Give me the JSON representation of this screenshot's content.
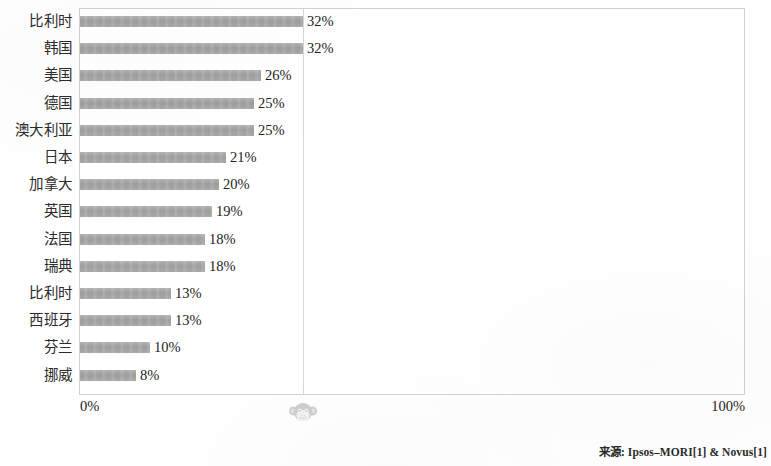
{
  "chart_data": {
    "type": "bar",
    "orientation": "horizontal",
    "title": "",
    "subtitle": "",
    "xlabel": "",
    "ylabel": "",
    "xlim": [
      0,
      100
    ],
    "grid": true,
    "gridlines_x": [
      32
    ],
    "legend": null,
    "legend_position": "none",
    "categories": [
      "比利时",
      "韩国",
      "美国",
      "德国",
      "澳大利亚",
      "日本",
      "加拿大",
      "英国",
      "法国",
      "瑞典",
      "比利时",
      "西班牙",
      "芬兰",
      "挪威"
    ],
    "values": [
      32,
      32,
      26,
      25,
      25,
      21,
      20,
      19,
      18,
      18,
      13,
      13,
      10,
      8
    ],
    "value_labels": [
      "32%",
      "32%",
      "26%",
      "25%",
      "25%",
      "21%",
      "20%",
      "19%",
      "18%",
      "18%",
      "13%",
      "13%",
      "10%",
      "8%"
    ],
    "axis_tick_labels": [
      "0%",
      "100%"
    ],
    "bar_color": "#a3a3a3",
    "plot_border_color": "#d2d2d2",
    "text_color": "#222222"
  },
  "axis": {
    "min_label": "0%",
    "max_label": "100%"
  },
  "footer": {
    "source_text": "来源: Ipsos–MORI[1] & Novus[1]"
  },
  "watermark": {
    "icon_name": "monkey-face-icon"
  }
}
